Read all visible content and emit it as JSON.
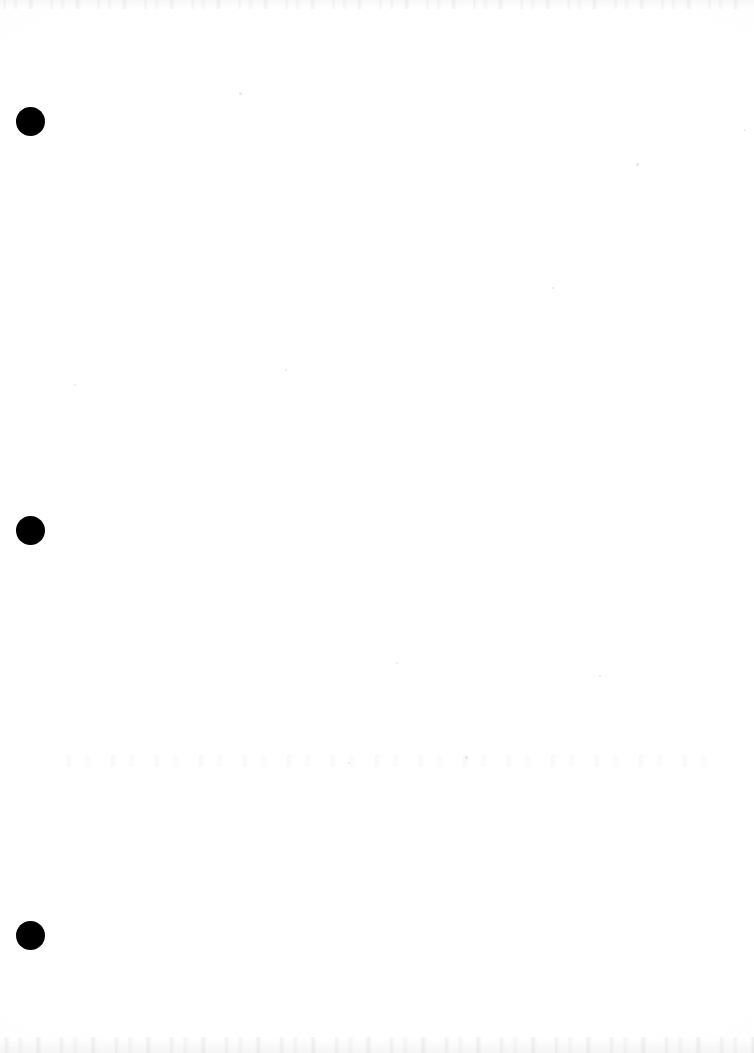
{
  "page": {
    "kind": "scanned-document-page",
    "width": 754,
    "height": 1053,
    "background_color": "#ffffff",
    "content_text": "",
    "note": "Blank scanned sheet — no printed text, headings, figures or captions are visible."
  },
  "marks": {
    "ink_color": "#000000",
    "punch_holes": [
      {
        "name": "punch-hole-top",
        "cx": 30,
        "cy": 121,
        "diameter": 29
      },
      {
        "name": "punch-hole-middle",
        "cx": 30,
        "cy": 530,
        "diameter": 29
      },
      {
        "name": "punch-hole-bottom",
        "cx": 30,
        "cy": 935,
        "diameter": 29
      }
    ],
    "dust_specks": [
      {
        "x": 240,
        "y": 93,
        "size": 3
      },
      {
        "x": 637,
        "y": 164,
        "size": 3
      },
      {
        "x": 745,
        "y": 130,
        "size": 2
      },
      {
        "x": 286,
        "y": 370,
        "size": 2
      },
      {
        "x": 553,
        "y": 288,
        "size": 2
      },
      {
        "x": 397,
        "y": 663,
        "size": 2
      },
      {
        "x": 600,
        "y": 676,
        "size": 2
      },
      {
        "x": 75,
        "y": 385,
        "size": 2
      },
      {
        "x": 466,
        "y": 757,
        "size": 3
      },
      {
        "x": 349,
        "y": 763,
        "size": 2
      }
    ],
    "artifact_bands": [
      {
        "name": "scanner-noise-top",
        "y": 0,
        "height": 9
      },
      {
        "name": "scanner-noise-bottom",
        "y": 1037,
        "height": 16
      },
      {
        "name": "bleed-through-band",
        "y": 755,
        "height": 12
      }
    ]
  }
}
